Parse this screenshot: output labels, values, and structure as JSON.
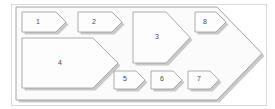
{
  "diagram": {
    "type": "nested-chevron-process-diagram",
    "frame": {
      "name": "outer-frame",
      "x": 11,
      "y": 4,
      "width": 255,
      "height": 101,
      "stroke": "#d9d9d9",
      "fill": "#ffffff"
    },
    "container": {
      "name": "container-chevron",
      "label": "",
      "points": "16,7 217,7 262,53.5 217,100 16,100",
      "fill": "#fbfbfb",
      "stroke": "#8f8f8f",
      "shadow": "#b8b8b8"
    },
    "style": {
      "shape_fill": "#fdfdfd",
      "shape_stroke": "#9a9a9a",
      "shadow_color": "#bdbdbd",
      "label_color": "#4a4a4a",
      "frame_stroke": "#d9d9d9",
      "background": "#ffffff"
    },
    "shapes": [
      {
        "id": "shape-1",
        "label": "1",
        "points": "22,12 56,12 66,22 56,32 22,32",
        "label_x": 38,
        "label_y": 22.5
      },
      {
        "id": "shape-2",
        "label": "2",
        "points": "78,12 112,12 122,22 112,32 78,32",
        "label_x": 94,
        "label_y": 22.5
      },
      {
        "id": "shape-3",
        "label": "3",
        "points": "133,12 166,12 190,37.5 166,63 133,63",
        "label_x": 157,
        "label_y": 37
      },
      {
        "id": "shape-8",
        "label": "8",
        "points": "195,12 216,12 226,22 216,32 195,32",
        "label_x": 205,
        "label_y": 22.5
      },
      {
        "id": "shape-4",
        "label": "4",
        "points": "22,38 93,38 118,63 93,88 22,88",
        "label_x": 60,
        "label_y": 63
      },
      {
        "id": "shape-5",
        "label": "5",
        "points": "114,71 136,71 145,80 136,89 114,89",
        "label_x": 125,
        "label_y": 79.5
      },
      {
        "id": "shape-6",
        "label": "6",
        "points": "151,71 173,71 182,80 173,89 151,89",
        "label_x": 162,
        "label_y": 79.5
      },
      {
        "id": "shape-7",
        "label": "7",
        "points": "188,71 210,71 219,80 210,89 188,89",
        "label_x": 199,
        "label_y": 79.5
      }
    ]
  }
}
